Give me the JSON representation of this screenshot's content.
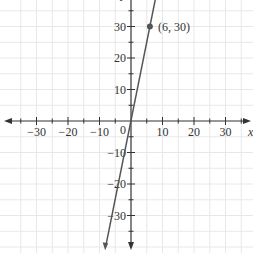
{
  "chart_data": {
    "type": "line",
    "title": "",
    "xlabel": "x",
    "ylabel": "y",
    "xlim": [
      -41,
      38
    ],
    "ylim": [
      -41,
      38
    ],
    "grid": true,
    "grid_step": 5,
    "x_ticks": [
      -30,
      -20,
      -10,
      10,
      20,
      30
    ],
    "y_ticks": [
      30,
      20,
      10,
      -10,
      -20,
      -30
    ],
    "x_tick_labels": [
      "−30",
      "−20",
      "−10",
      "10",
      "20",
      "30"
    ],
    "y_tick_labels": [
      "30",
      "20",
      "10",
      "−10",
      "−20",
      "−30"
    ],
    "origin_label": "0",
    "series": [
      {
        "name": "y = 5x",
        "equation": "y = 5x",
        "slope": 5,
        "intercept": 0,
        "x": [
          -8.2,
          7.7
        ],
        "y": [
          -41,
          38.5
        ],
        "color": "#555555"
      }
    ],
    "points": [
      {
        "x": 6,
        "y": 30,
        "label": "(6, 30)",
        "color": "#555555"
      }
    ],
    "annotations": [
      "(6, 30)"
    ]
  },
  "colors": {
    "grid": "#e6e6e6",
    "axis": "#333333",
    "line": "#555555"
  }
}
